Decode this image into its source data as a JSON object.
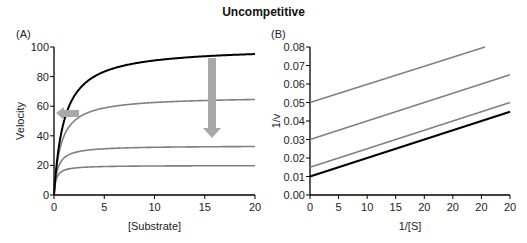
{
  "figure": {
    "title": "Uncompetitive",
    "panel_a_label": "(A)",
    "panel_b_label": "(B)"
  },
  "colors": {
    "uninhibited": "#000000",
    "inhibited": "#808080",
    "arrow": "#a9a9a9"
  },
  "chart_data": [
    {
      "panel": "A",
      "type": "line",
      "title": "",
      "xlabel": "[Substrate]",
      "ylabel": "Velocity",
      "xlim": [
        0,
        20
      ],
      "ylim": [
        0,
        100
      ],
      "xticks": [
        "0",
        "5",
        "10",
        "15",
        "20"
      ],
      "yticks": [
        "0",
        "20",
        "40",
        "60",
        "80",
        "100"
      ],
      "grid": false,
      "model": "Michaelis-Menten v = Vmax*S/(Km+S)",
      "series": [
        {
          "name": "No inhibitor",
          "color": "#000000",
          "Vmax": 100,
          "Km": 1.0,
          "x": [
            0,
            1,
            2,
            3,
            5,
            10,
            15,
            20
          ],
          "values": [
            0,
            50,
            66.7,
            75,
            83.3,
            90.9,
            93.8,
            95.2
          ]
        },
        {
          "name": "Inhibitor level 1",
          "color": "#808080",
          "Vmax": 66.7,
          "Km": 0.67,
          "x": [
            0,
            1,
            2,
            3,
            5,
            10,
            15,
            20
          ],
          "values": [
            0,
            40,
            50,
            54.5,
            58.8,
            62.5,
            63.8,
            64.5
          ]
        },
        {
          "name": "Inhibitor level 2",
          "color": "#808080",
          "Vmax": 33.3,
          "Km": 0.33,
          "x": [
            0,
            1,
            2,
            3,
            5,
            10,
            15,
            20
          ],
          "values": [
            0,
            25,
            28.6,
            30,
            31.3,
            32.3,
            32.6,
            32.8
          ]
        },
        {
          "name": "Inhibitor level 3",
          "color": "#808080",
          "Vmax": 20,
          "Km": 0.2,
          "x": [
            0,
            1,
            2,
            3,
            5,
            10,
            15,
            20
          ],
          "values": [
            0,
            16.7,
            18.2,
            18.8,
            19.2,
            19.6,
            19.7,
            19.8
          ]
        }
      ],
      "annotations": [
        {
          "type": "arrow",
          "direction": "left",
          "meaning": "Km decreases",
          "at": {
            "x": 1.5,
            "y": 56
          }
        },
        {
          "type": "arrow",
          "direction": "down",
          "meaning": "Vmax decreases",
          "at": {
            "x": 16,
            "y": [
              95,
              40
            ]
          }
        }
      ]
    },
    {
      "panel": "B",
      "type": "line",
      "title": "",
      "xlabel": "1/[S]",
      "ylabel": "1/v",
      "xlim": [
        0,
        20
      ],
      "ylim": [
        0,
        0.08
      ],
      "xticks": [
        "0",
        "5",
        "10",
        "15",
        "20",
        "20",
        "20",
        "20"
      ],
      "yticks": [
        "0.00",
        "0.01",
        "0.02",
        "0.03",
        "0.04",
        "0.05",
        "0.06",
        "0.07",
        "0.08"
      ],
      "grid": false,
      "series": [
        {
          "name": "No inhibitor",
          "color": "#000000",
          "x": [
            0,
            20
          ],
          "values": [
            0.01,
            0.045
          ]
        },
        {
          "name": "Inhibitor level 1",
          "color": "#808080",
          "x": [
            0,
            20
          ],
          "values": [
            0.015,
            0.05
          ]
        },
        {
          "name": "Inhibitor level 2",
          "color": "#808080",
          "x": [
            0,
            20
          ],
          "values": [
            0.03,
            0.065
          ]
        },
        {
          "name": "Inhibitor level 3",
          "color": "#808080",
          "x": [
            0,
            17.5
          ],
          "values": [
            0.05,
            0.08
          ]
        }
      ]
    }
  ]
}
